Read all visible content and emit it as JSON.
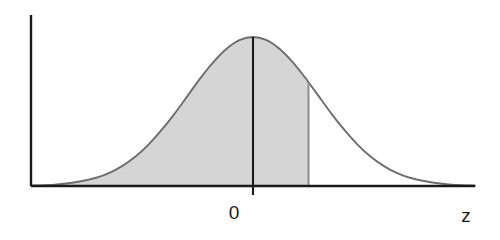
{
  "figure": {
    "title": "",
    "background_color": "#ffffff",
    "width": 500,
    "height": 240
  },
  "axes": {
    "x_axis_label": "z",
    "y_axis_label": "",
    "x_tick_labels": [
      "0"
    ],
    "origin_label": "0",
    "axis_color": "#1a1a1a",
    "x_axis_start_px": 31,
    "x_axis_end_px": 475,
    "baseline_y_px": 186,
    "y_axis_x_px": 31,
    "y_axis_top_px": 15
  },
  "curve": {
    "name": "standard-normal-density",
    "line_color": "#6e6e6e",
    "fill_color": "#d5d5d5",
    "mean": 0,
    "sd": 1,
    "peak_x_px": 234,
    "peak_y_px": 37
  },
  "shaded_region": {
    "name": "cumulative-area-left-of-z",
    "fill_color": "#d5d5d5",
    "from_label": "-infinity",
    "to_label": "z",
    "right_boundary_x_px": 289,
    "right_boundary_top_y_px": 120,
    "probability_label": ""
  },
  "center_line": {
    "name": "mean-reference-line",
    "color": "#1a1a1a",
    "x_px": 234,
    "top_y_px": 37,
    "bottom_y_px": 195
  },
  "chart_data": {
    "type": "area",
    "title": "",
    "subtitle": "",
    "xlabel": "z",
    "ylabel": "",
    "grid": false,
    "legend": "none",
    "xlim": [
      -3.4,
      3.4
    ],
    "ylim": [
      0,
      0.42
    ],
    "xtick_values": [
      0
    ],
    "xtick_labels": [
      "0"
    ],
    "annotations": [
      {
        "text": "0",
        "x": 0,
        "y": 0,
        "position": "below-axis"
      },
      {
        "text": "z",
        "x": 3.3,
        "y": 0,
        "position": "axis-end-label"
      }
    ],
    "series": [
      {
        "name": "standard normal density",
        "line_color": "#6e6e6e",
        "fill_color": "#d5d5d5",
        "fill_from": -3.4,
        "fill_to": 0.85,
        "x": [
          -3.4,
          -3.2,
          -3.0,
          -2.8,
          -2.6,
          -2.4,
          -2.2,
          -2.0,
          -1.8,
          -1.6,
          -1.4,
          -1.2,
          -1.0,
          -0.8,
          -0.6,
          -0.4,
          -0.2,
          0.0,
          0.2,
          0.4,
          0.6,
          0.8,
          0.85,
          1.0,
          1.2,
          1.4,
          1.6,
          1.8,
          2.0,
          2.2,
          2.4,
          2.6,
          2.8,
          3.0,
          3.2,
          3.4
        ],
        "y": [
          0.001,
          0.002,
          0.004,
          0.008,
          0.014,
          0.022,
          0.035,
          0.054,
          0.079,
          0.111,
          0.15,
          0.194,
          0.242,
          0.29,
          0.333,
          0.368,
          0.391,
          0.399,
          0.391,
          0.368,
          0.333,
          0.29,
          0.278,
          0.242,
          0.194,
          0.15,
          0.111,
          0.079,
          0.054,
          0.035,
          0.022,
          0.014,
          0.008,
          0.004,
          0.002,
          0.001
        ]
      }
    ]
  }
}
